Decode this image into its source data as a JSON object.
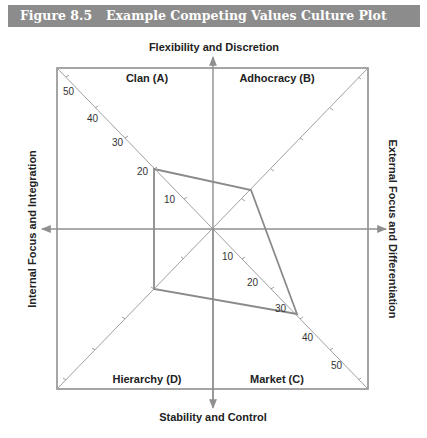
{
  "figure": {
    "number": "Figure 8.5",
    "title": "Example Competing Values Culture Plot"
  },
  "axes": {
    "top": "Flexibility and Discretion",
    "bottom": "Stability and Control",
    "left": "Internal Focus and Integration",
    "right": "External Focus and Differentiation"
  },
  "quadrants": {
    "top_left": "Clan (A)",
    "top_right": "Adhocracy (B)",
    "bottom_right": "Market (C)",
    "bottom_left": "Hierarchy (D)"
  },
  "scale_labels": {
    "clan": [
      "10",
      "20",
      "30",
      "40",
      "50"
    ],
    "market": [
      "10",
      "20",
      "30",
      "40",
      "50"
    ]
  },
  "colors": {
    "line": "#8f8f8f",
    "title_bg": "#8c8c8c",
    "title_text": "#ffffff"
  },
  "chart_data": {
    "type": "radar",
    "title": "Example Competing Values Culture Plot",
    "axes": [
      "Clan (A)",
      "Adhocracy (B)",
      "Market (C)",
      "Hierarchy (D)"
    ],
    "scale": [
      0,
      50
    ],
    "ticks": [
      10,
      20,
      30,
      40,
      50
    ],
    "series": [
      {
        "name": "Culture profile",
        "values": [
          20,
          13,
          28,
          20
        ]
      }
    ]
  }
}
